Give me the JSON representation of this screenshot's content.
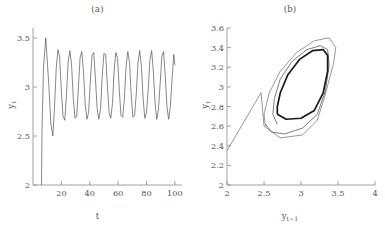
{
  "figure": {
    "background": "#ffffff",
    "line_color": "#555555",
    "axis_color": "#8a8a8a",
    "limit_cycle_color": "#1a1a1a"
  },
  "panels": [
    {
      "id": "a",
      "title": "(a)",
      "xlabel": "t",
      "ylabel": "y",
      "ylabel_sub": "t"
    },
    {
      "id": "b",
      "title": "(b)",
      "xlabel": "y",
      "xlabel_sub": "t−1",
      "ylabel": "y",
      "ylabel_sub": "t"
    }
  ],
  "chart_data": [
    {
      "type": "line",
      "panel": "a",
      "title": "(a)",
      "xlabel": "t",
      "ylabel": "y_t",
      "xlim": [
        0,
        105
      ],
      "ylim": [
        2,
        3.6
      ],
      "xticks": [
        20,
        40,
        60,
        80,
        100
      ],
      "xticklabels": [
        "20",
        "40",
        "60",
        "80",
        "100"
      ],
      "yticks": [
        2,
        2.5,
        3,
        3.5
      ],
      "yticklabels": [
        "2",
        "2.5",
        "3",
        "3.5"
      ],
      "grid": false,
      "legend": null,
      "description": "Time series of y_t showing a sharp initial transient rise from 2 to 3.5 followed by damped oscillations settling into a sustained period-2-like limit cycle with peaks near 3.38 and troughs near 2.67.",
      "series": [
        {
          "name": "y_t",
          "x": [
            6.0,
            6.4,
            7.4,
            9.0,
            11.0,
            12.6,
            14.0,
            15.2,
            16.4,
            17.6,
            18.8,
            20.0,
            21.2,
            22.4,
            23.6,
            24.8,
            26.0,
            27.2,
            28.4,
            29.6,
            30.8,
            32.0,
            33.2,
            34.4,
            35.6,
            36.8,
            38.0,
            39.2,
            40.4,
            41.6,
            42.8,
            44.0,
            45.2,
            46.4,
            47.6,
            48.8,
            50.0,
            51.2,
            52.4,
            53.6,
            54.8,
            56.0,
            57.2,
            58.4,
            59.6,
            60.8,
            62.0,
            63.2,
            64.4,
            65.6,
            66.8,
            68.0,
            69.2,
            70.4,
            71.6,
            72.8,
            74.0,
            75.2,
            76.4,
            77.6,
            78.8,
            80.0,
            81.2,
            82.4,
            83.6,
            84.8,
            86.0,
            87.2,
            88.4,
            89.6,
            90.8,
            92.0,
            93.2,
            94.4,
            95.6,
            96.8,
            98.0,
            99.2,
            100.0
          ],
          "y": [
            2.0,
            2.6,
            3.2,
            3.5,
            3.05,
            2.62,
            2.5,
            2.8,
            3.2,
            3.38,
            3.3,
            2.95,
            2.7,
            2.66,
            2.92,
            3.26,
            3.37,
            3.22,
            2.88,
            2.68,
            2.7,
            3.0,
            3.3,
            3.36,
            3.14,
            2.82,
            2.67,
            2.74,
            3.06,
            3.32,
            3.35,
            3.08,
            2.78,
            2.67,
            2.78,
            3.12,
            3.34,
            3.33,
            3.02,
            2.74,
            2.68,
            2.83,
            3.17,
            3.35,
            3.29,
            2.97,
            2.71,
            2.69,
            2.88,
            3.21,
            3.36,
            3.25,
            2.92,
            2.69,
            2.71,
            2.93,
            3.25,
            3.37,
            3.21,
            2.88,
            2.68,
            2.74,
            2.98,
            3.28,
            3.37,
            3.16,
            2.84,
            2.67,
            2.77,
            3.03,
            3.31,
            3.36,
            3.11,
            2.8,
            2.67,
            2.8,
            3.08,
            3.33,
            3.22
          ]
        }
      ]
    },
    {
      "type": "line",
      "panel": "b",
      "title": "(b)",
      "xlabel": "y_{t-1}",
      "ylabel": "y_t",
      "xlim": [
        2,
        4
      ],
      "ylim": [
        2,
        3.6
      ],
      "xticks": [
        2,
        2.5,
        3,
        3.5,
        4
      ],
      "xticklabels": [
        "2",
        "2.5",
        "3",
        "3.5",
        "4"
      ],
      "yticks": [
        2,
        2.2,
        2.4,
        2.6,
        2.8,
        3,
        3.2,
        3.4,
        3.6
      ],
      "yticklabels": [
        "2",
        "2.2",
        "2.4",
        "2.6",
        "2.8",
        "3",
        "3.2",
        "3.4",
        "3.6"
      ],
      "grid": false,
      "legend": null,
      "description": "Phase portrait of y_t versus y_{t-1}. A transient trajectory enters from the lower left near (2, 2.35), spirals inward through progressively smaller elongated loops, and converges onto a thick elongated closed limit cycle oriented along the 45-degree diagonal.",
      "series": [
        {
          "name": "transient-outer-loop",
          "x": [
            2.0,
            2.46,
            2.5,
            2.72,
            3.02,
            3.22,
            3.32,
            3.44,
            3.47,
            3.38,
            3.18,
            2.94,
            2.72,
            2.57,
            2.5,
            2.52
          ],
          "y": [
            2.35,
            2.94,
            2.6,
            2.48,
            2.51,
            2.66,
            2.9,
            3.24,
            3.4,
            3.5,
            3.47,
            3.35,
            3.16,
            2.94,
            2.72,
            2.6
          ]
        },
        {
          "name": "transient-middle-loop",
          "x": [
            2.52,
            2.6,
            2.78,
            3.02,
            3.22,
            3.33,
            3.38,
            3.36,
            3.26,
            3.08,
            2.88,
            2.72,
            2.64,
            2.62,
            2.68
          ],
          "y": [
            2.62,
            2.54,
            2.52,
            2.58,
            2.72,
            2.96,
            3.22,
            3.38,
            3.42,
            3.38,
            3.26,
            3.08,
            2.88,
            2.72,
            2.62
          ]
        },
        {
          "name": "limit-cycle",
          "x": [
            2.68,
            2.8,
            3.0,
            3.18,
            3.3,
            3.36,
            3.36,
            3.3,
            3.16,
            2.98,
            2.82,
            2.72,
            2.68,
            2.68
          ],
          "y": [
            2.72,
            2.67,
            2.68,
            2.76,
            2.94,
            3.16,
            3.32,
            3.38,
            3.37,
            3.28,
            3.12,
            2.94,
            2.8,
            2.72
          ]
        }
      ]
    }
  ]
}
